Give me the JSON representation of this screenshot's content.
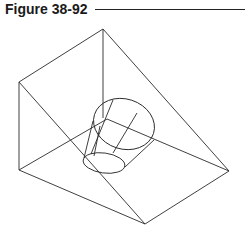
{
  "figure": {
    "title": "Figure 38-92",
    "line_color": "#2a2a2a"
  }
}
